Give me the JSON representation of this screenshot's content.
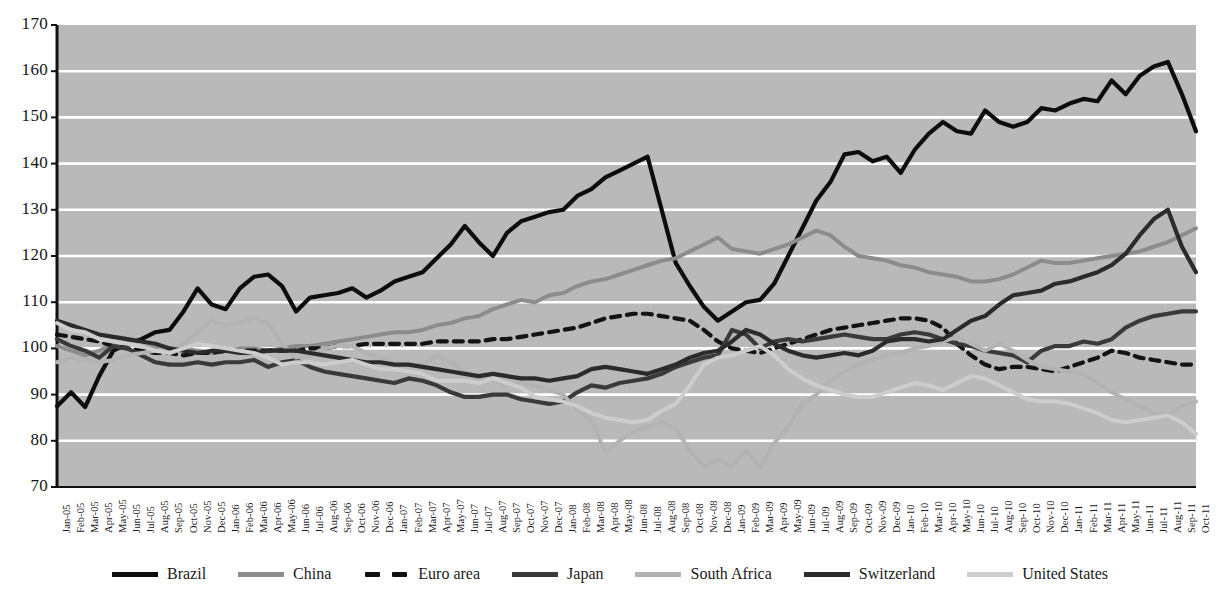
{
  "chart_data": {
    "type": "line",
    "title": "",
    "xlabel": "",
    "ylabel": "",
    "ylim": [
      70,
      170
    ],
    "ytick_step": 10,
    "yticks": [
      70,
      80,
      90,
      100,
      110,
      120,
      130,
      140,
      150,
      160,
      170
    ],
    "grid": "horizontal",
    "legend_position": "bottom",
    "plot_background": "#b9b9b9",
    "gridline_color": "#ffffff",
    "axis_color": "#111111",
    "x": [
      "Jan-05",
      "Feb-05",
      "Mar-05",
      "Apr-05",
      "May-05",
      "Jun-05",
      "Jul-05",
      "Aug-05",
      "Sep-05",
      "Oct-05",
      "Nov-05",
      "Dec-05",
      "Jan-06",
      "Feb-06",
      "Mar-06",
      "Apr-06",
      "May-06",
      "Jun-06",
      "Jul-06",
      "Aug-06",
      "Sep-06",
      "Oct-06",
      "Nov-06",
      "Dec-06",
      "Jan-07",
      "Feb-07",
      "Mar-07",
      "Apr-07",
      "May-07",
      "Jun-07",
      "Jul-07",
      "Aug-07",
      "Sep-07",
      "Oct-07",
      "Nov-07",
      "Dec-07",
      "Jan-08",
      "Feb-08",
      "Mar-08",
      "Apr-08",
      "May-08",
      "Jun-08",
      "Jul-08",
      "Aug-08",
      "Sep-08",
      "Oct-08",
      "Nov-08",
      "Dec-08",
      "Jan-09",
      "Feb-09",
      "Mar-09",
      "Apr-09",
      "May-09",
      "Jun-09",
      "Jul-09",
      "Aug-09",
      "Sep-09",
      "Oct-09",
      "Nov-09",
      "Dec-09",
      "Jan-10",
      "Feb-10",
      "Mar-10",
      "Apr-10",
      "May-10",
      "Jun-10",
      "Jul-10",
      "Aug-10",
      "Sep-10",
      "Oct-10",
      "Nov-10",
      "Dec-10",
      "Jan-11",
      "Feb-11",
      "Mar-11",
      "Apr-11",
      "May-11",
      "Jun-11",
      "Jul-11",
      "Aug-11",
      "Sep-11",
      "Oct-11"
    ],
    "series": [
      {
        "name": "Brazil",
        "color": "#0d0d0d",
        "width": 4.2,
        "dash": "none",
        "values": [
          87.5,
          90.5,
          87.3,
          94.0,
          99.5,
          101.0,
          102.0,
          103.5,
          104.0,
          108.0,
          113.0,
          109.5,
          108.5,
          113.0,
          115.5,
          116.0,
          113.5,
          108.0,
          111.0,
          111.5,
          112.0,
          113.0,
          111.0,
          112.5,
          114.5,
          115.5,
          116.5,
          119.5,
          122.5,
          126.5,
          123.0,
          120.0,
          125.0,
          127.5,
          128.5,
          129.5,
          130.0,
          133.0,
          134.5,
          137.0,
          138.5,
          140.0,
          141.5,
          130.0,
          118.5,
          113.5,
          109.0,
          106.0,
          108.0,
          110.0,
          110.5,
          114.0,
          120.0,
          126.0,
          132.0,
          136.0,
          142.0,
          142.5,
          140.5,
          141.5,
          138.0,
          143.0,
          146.5,
          149.0,
          147.0,
          146.5,
          151.5,
          149.0,
          148.0,
          149.0,
          152.0,
          151.5,
          153.0,
          154.0,
          153.5,
          158.0,
          155.0,
          159.0,
          161.0,
          162.0,
          155.0,
          147.0
        ]
      },
      {
        "name": "China",
        "color": "#8c8c8c",
        "width": 4.0,
        "dash": "none",
        "values": [
          100.5,
          99.5,
          98.5,
          99.5,
          101.0,
          101.5,
          100.5,
          100.0,
          99.5,
          100.0,
          99.5,
          99.0,
          99.5,
          100.0,
          100.0,
          99.5,
          100.0,
          100.5,
          100.5,
          101.0,
          101.5,
          102.0,
          102.5,
          103.0,
          103.5,
          103.5,
          104.0,
          105.0,
          105.5,
          106.5,
          107.0,
          108.5,
          109.5,
          110.5,
          110.0,
          111.5,
          112.0,
          113.5,
          114.5,
          115.0,
          116.0,
          117.0,
          118.0,
          119.0,
          119.5,
          121.0,
          122.5,
          124.0,
          121.5,
          121.0,
          120.5,
          121.5,
          122.5,
          124.0,
          125.5,
          124.5,
          122.0,
          120.0,
          119.5,
          119.0,
          118.0,
          117.5,
          116.5,
          116.0,
          115.5,
          114.5,
          114.5,
          115.0,
          116.0,
          117.5,
          119.0,
          118.5,
          118.5,
          119.0,
          119.5,
          120.0,
          120.5,
          121.0,
          122.0,
          123.0,
          124.5,
          126.0
        ]
      },
      {
        "name": "Euro area",
        "color": "#131313",
        "width": 4.2,
        "dash": "9,7",
        "values": [
          103.0,
          102.5,
          102.0,
          101.5,
          100.5,
          100.0,
          99.5,
          99.0,
          99.0,
          98.5,
          99.0,
          99.0,
          99.5,
          99.5,
          99.5,
          99.5,
          99.5,
          99.5,
          100.0,
          100.0,
          100.5,
          100.5,
          101.0,
          101.0,
          101.0,
          101.0,
          101.0,
          101.5,
          101.5,
          101.5,
          101.5,
          102.0,
          102.0,
          102.5,
          103.0,
          103.5,
          104.0,
          104.5,
          105.5,
          106.5,
          107.0,
          107.5,
          107.5,
          107.0,
          106.5,
          106.0,
          104.0,
          101.5,
          100.0,
          99.5,
          99.0,
          100.0,
          101.0,
          102.0,
          103.0,
          104.0,
          104.5,
          105.0,
          105.5,
          106.0,
          106.5,
          106.5,
          106.0,
          104.5,
          101.0,
          98.5,
          96.5,
          95.5,
          96.0,
          96.0,
          95.5,
          95.0,
          96.0,
          97.0,
          98.0,
          99.5,
          99.0,
          98.0,
          97.5,
          97.0,
          96.5,
          96.5
        ]
      },
      {
        "name": "Japan",
        "color": "#3a3a3a",
        "width": 4.2,
        "dash": "none",
        "values": [
          102.0,
          100.5,
          99.5,
          98.0,
          100.5,
          100.0,
          98.5,
          97.0,
          96.5,
          96.5,
          97.0,
          96.5,
          97.0,
          97.0,
          97.5,
          96.0,
          97.0,
          97.5,
          96.0,
          95.0,
          94.5,
          94.0,
          93.5,
          93.0,
          92.5,
          93.5,
          93.0,
          92.0,
          90.5,
          89.5,
          89.5,
          90.0,
          90.0,
          89.0,
          88.5,
          88.0,
          88.5,
          90.5,
          92.0,
          91.5,
          92.5,
          93.0,
          93.5,
          94.5,
          96.0,
          97.0,
          98.0,
          98.5,
          104.0,
          103.0,
          100.0,
          101.5,
          102.0,
          101.5,
          102.0,
          102.5,
          103.0,
          102.5,
          102.0,
          102.0,
          103.0,
          103.5,
          103.0,
          102.0,
          101.0,
          100.5,
          99.5,
          99.0,
          98.5,
          97.0,
          99.5,
          100.5,
          100.5,
          101.5,
          101.0,
          102.0,
          104.5,
          106.0,
          107.0,
          107.5,
          108.0,
          108.0
        ]
      },
      {
        "name": "South Africa",
        "color": "#b3b3b3",
        "width": 4.0,
        "dash": "none",
        "values": [
          97.0,
          98.0,
          97.5,
          97.0,
          97.5,
          98.5,
          99.0,
          99.5,
          100.0,
          101.0,
          103.5,
          106.0,
          105.0,
          105.5,
          106.5,
          105.5,
          101.0,
          98.0,
          98.5,
          100.0,
          100.5,
          100.5,
          99.0,
          98.0,
          97.0,
          96.5,
          96.5,
          98.5,
          97.0,
          95.0,
          93.5,
          93.0,
          92.0,
          92.5,
          92.0,
          91.0,
          90.0,
          86.5,
          84.5,
          77.5,
          80.0,
          82.0,
          83.0,
          84.0,
          82.5,
          78.0,
          74.5,
          76.0,
          74.5,
          78.0,
          74.0,
          79.5,
          83.0,
          88.0,
          90.0,
          93.0,
          95.0,
          96.5,
          97.5,
          98.5,
          99.0,
          100.0,
          100.5,
          101.5,
          102.5,
          101.0,
          99.5,
          101.0,
          99.5,
          97.5,
          96.0,
          95.5,
          95.0,
          94.5,
          92.5,
          90.5,
          89.0,
          87.5,
          86.0,
          85.5,
          87.5,
          88.5
        ]
      },
      {
        "name": "Switzerland",
        "color": "#2b2b2b",
        "width": 4.2,
        "dash": "none",
        "values": [
          106.0,
          105.0,
          104.0,
          103.0,
          102.5,
          102.0,
          101.5,
          101.0,
          100.0,
          99.5,
          99.0,
          99.5,
          99.5,
          99.0,
          99.0,
          99.5,
          99.5,
          99.5,
          99.0,
          98.5,
          98.0,
          97.5,
          97.0,
          97.0,
          96.5,
          96.5,
          96.0,
          95.5,
          95.0,
          94.5,
          94.0,
          94.5,
          94.0,
          93.5,
          93.5,
          93.0,
          93.5,
          94.0,
          95.5,
          96.0,
          95.5,
          95.0,
          94.5,
          95.5,
          96.5,
          98.0,
          99.0,
          99.5,
          101.5,
          104.0,
          103.0,
          101.0,
          99.5,
          98.5,
          98.0,
          98.5,
          99.0,
          98.5,
          99.5,
          101.5,
          102.0,
          102.0,
          101.5,
          102.0,
          104.0,
          106.0,
          107.0,
          109.5,
          111.5,
          112.0,
          112.5,
          114.0,
          114.5,
          115.5,
          116.5,
          118.0,
          120.5,
          124.5,
          128.0,
          130.0,
          122.0,
          116.5
        ]
      },
      {
        "name": "United States",
        "color": "#cdcdcd",
        "width": 4.0,
        "dash": "none",
        "values": [
          105.5,
          104.0,
          103.5,
          102.0,
          101.5,
          101.0,
          100.5,
          99.5,
          99.0,
          100.0,
          101.0,
          100.5,
          100.0,
          99.5,
          99.0,
          98.0,
          96.5,
          97.0,
          97.0,
          96.5,
          97.0,
          97.5,
          96.5,
          95.5,
          95.5,
          95.0,
          94.5,
          93.0,
          93.0,
          93.0,
          92.5,
          93.5,
          92.5,
          91.5,
          89.5,
          89.0,
          88.5,
          87.5,
          86.0,
          85.0,
          84.5,
          84.0,
          84.5,
          86.5,
          88.0,
          92.0,
          96.5,
          98.0,
          98.5,
          99.5,
          100.5,
          98.5,
          95.5,
          93.5,
          92.0,
          91.0,
          90.0,
          89.5,
          89.5,
          90.5,
          91.5,
          92.5,
          92.0,
          91.0,
          92.5,
          94.0,
          93.5,
          92.0,
          90.5,
          89.0,
          88.5,
          88.5,
          88.0,
          87.0,
          86.0,
          84.5,
          84.0,
          84.5,
          85.0,
          85.5,
          84.0,
          81.5
        ]
      }
    ]
  },
  "legend": {
    "items": [
      {
        "label": "Brazil"
      },
      {
        "label": "China"
      },
      {
        "label": "Euro area"
      },
      {
        "label": "Japan"
      },
      {
        "label": "South Africa"
      },
      {
        "label": "Switzerland"
      },
      {
        "label": "United States"
      }
    ]
  }
}
